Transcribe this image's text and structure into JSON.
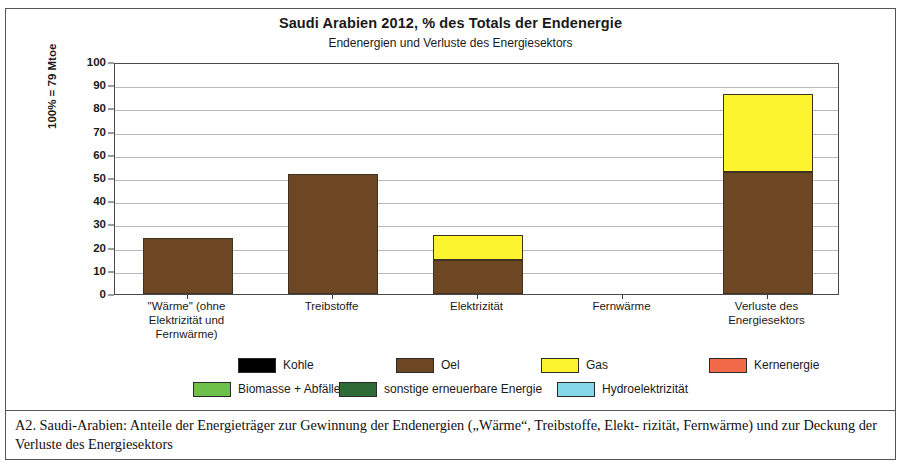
{
  "figure": {
    "title": "Saudi Arabien  2012, % des Totals der Endenergie",
    "subtitle": "Endenergien und Verluste des Energiesektors",
    "caption_line1": "A2.  Saudi-Arabien:  Anteile der Energieträger zur Gewinnung der Endenergien („Wärme“, Treibstoffe, Elekt-",
    "caption_line2": "rizität, Fernwärme) und zur Deckung der Verluste des Energiesektors"
  },
  "colors": {
    "kohle": "#000000",
    "oel": "#6d4724",
    "gas": "#fdf430",
    "kernenergie": "#f2694a",
    "biomasse": "#6fc04b",
    "sonstige": "#2f6b36",
    "hydro": "#86d6ea",
    "gridline": "#b9b9b9",
    "axis": "#4a4a4a"
  },
  "legend": {
    "row1": [
      {
        "label": "Kohle",
        "color_key": "kohle"
      },
      {
        "label": "Oel",
        "color_key": "oel"
      },
      {
        "label": "Gas",
        "color_key": "gas"
      },
      {
        "label": "Kernenergie",
        "color_key": "kernenergie"
      }
    ],
    "row2": [
      {
        "label": "Biomasse + Abfälle",
        "color_key": "biomasse"
      },
      {
        "label": "sonstige erneuerbare Energie",
        "color_key": "sonstige"
      },
      {
        "label": "Hydroelektrizität",
        "color_key": "hydro"
      }
    ]
  },
  "chart_data": {
    "type": "bar",
    "stacked": true,
    "title": "Saudi Arabien  2012, % des Totals der Endenergie",
    "subtitle": "Endenergien und Verluste des Energiesektors",
    "xlabel": "",
    "ylabel": "100% = 79 Mtoe",
    "ylim": [
      0,
      100
    ],
    "yticks": [
      0,
      10,
      20,
      30,
      40,
      50,
      60,
      70,
      80,
      90,
      100
    ],
    "grid": true,
    "legend_position": "bottom",
    "categories": [
      "\"Wärme\" (ohne Elektrizität und Fernwärme)",
      "Treibstoffe",
      "Elektrizität",
      "Fernwärme",
      "Verluste des Energiesektors"
    ],
    "category_lines": [
      [
        "\"Wärme\" (ohne",
        "Elektrizität und",
        "Fernwärme)"
      ],
      [
        "Treibstoffe"
      ],
      [
        "Elektrizität"
      ],
      [
        "Fernwärme"
      ],
      [
        "Verluste des",
        "Energiesektors"
      ]
    ],
    "series": [
      {
        "name": "Kohle",
        "color_key": "kohle",
        "values": [
          0,
          0,
          0,
          0,
          0
        ]
      },
      {
        "name": "Oel",
        "color_key": "oel",
        "values": [
          24.3,
          51.6,
          14.6,
          0,
          52.6
        ]
      },
      {
        "name": "Gas",
        "color_key": "gas",
        "values": [
          0,
          0,
          11.0,
          0,
          33.4
        ]
      },
      {
        "name": "Kernenergie",
        "color_key": "kernenergie",
        "values": [
          0,
          0,
          0,
          0,
          0
        ]
      },
      {
        "name": "Biomasse + Abfälle",
        "color_key": "biomasse",
        "values": [
          0,
          0,
          0,
          0,
          0
        ]
      },
      {
        "name": "sonstige erneuerbare Energie",
        "color_key": "sonstige",
        "values": [
          0,
          0,
          0,
          0,
          0
        ]
      },
      {
        "name": "Hydroelektrizität",
        "color_key": "hydro",
        "values": [
          0,
          0,
          0,
          0,
          0
        ]
      }
    ],
    "totals": [
      24.3,
      51.6,
      25.6,
      0,
      86.0
    ]
  }
}
